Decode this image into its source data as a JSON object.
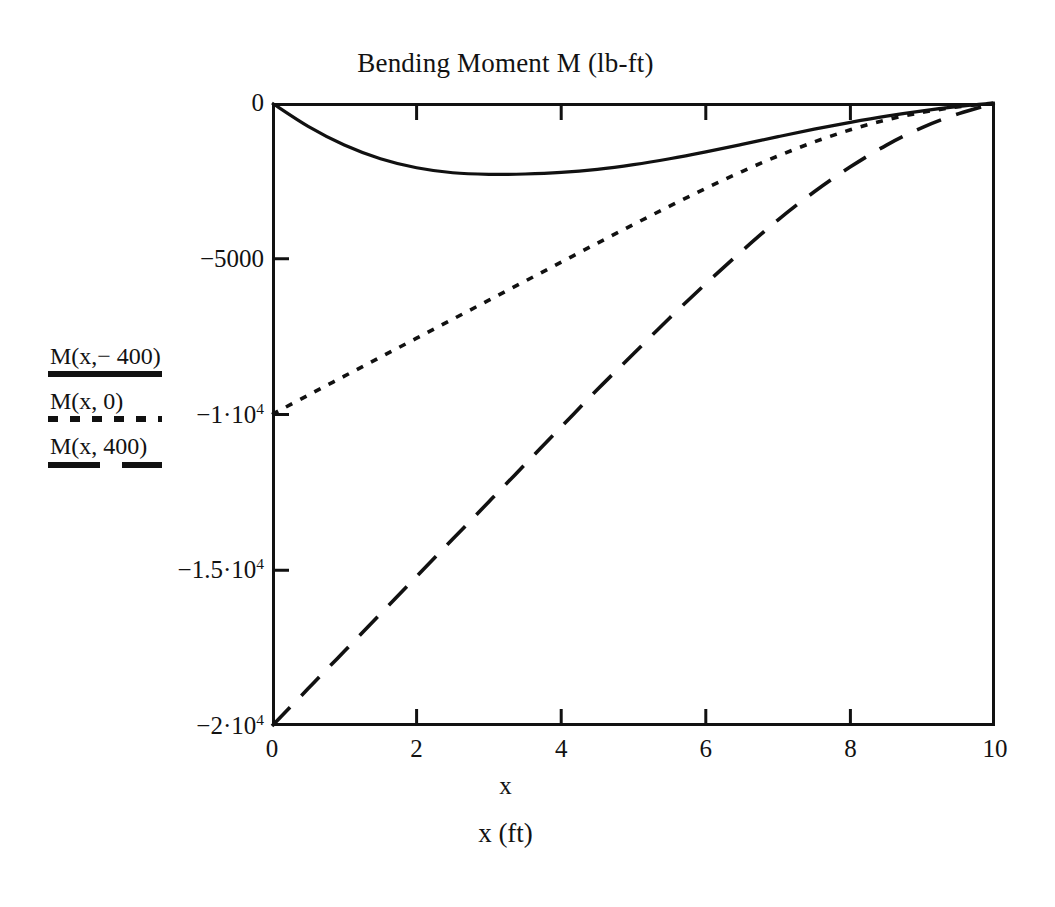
{
  "chart_data": {
    "type": "line",
    "title": "Bending Moment M (lb-ft)",
    "xlabel": "x",
    "xlabel_units": "x (ft)",
    "ylabel": "",
    "xlim": [
      0,
      10
    ],
    "ylim": [
      -20000,
      0
    ],
    "grid": false,
    "legend_position": "left-outside",
    "xticks": [
      "0",
      "2",
      "4",
      "6",
      "8",
      "10"
    ],
    "xtick_values": [
      0,
      2,
      4,
      6,
      8,
      10
    ],
    "ytick_values": [
      0,
      -5000,
      -10000,
      -15000,
      -20000
    ],
    "yticks": [
      {
        "text": "0",
        "mantissa": "0",
        "exponent": ""
      },
      {
        "text": "-5000",
        "mantissa": "−5000",
        "exponent": ""
      },
      {
        "text": "-1·10^4",
        "mantissa": "−1·10",
        "exponent": "4"
      },
      {
        "text": "-1.5·10^4",
        "mantissa": "−1.5·10",
        "exponent": "4"
      },
      {
        "text": "-2·10^4",
        "mantissa": "−2·10",
        "exponent": "4"
      }
    ],
    "series": [
      {
        "name": "M(x,−400)",
        "style": "solid",
        "x": [
          0,
          0.5,
          1,
          1.5,
          2,
          2.5,
          3,
          3.5,
          4,
          4.5,
          5,
          5.5,
          6,
          6.5,
          7,
          7.5,
          8,
          8.5,
          9,
          9.5,
          10
        ],
        "values": [
          0,
          -750,
          -1350,
          -1790,
          -2080,
          -2240,
          -2290,
          -2280,
          -2230,
          -2130,
          -1980,
          -1790,
          -1570,
          -1330,
          -1080,
          -840,
          -620,
          -420,
          -250,
          -110,
          0
        ]
      },
      {
        "name": "M(x,0)",
        "style": "dotted",
        "x": [
          0,
          0.5,
          1,
          1.5,
          2,
          2.5,
          3,
          3.5,
          4,
          4.5,
          5,
          5.5,
          6,
          6.5,
          7,
          7.5,
          8,
          8.5,
          9,
          9.5,
          10
        ],
        "values": [
          -10000,
          -9380,
          -8770,
          -8160,
          -7550,
          -6940,
          -6330,
          -5720,
          -5110,
          -4500,
          -3900,
          -3310,
          -2740,
          -2200,
          -1700,
          -1250,
          -860,
          -540,
          -300,
          -120,
          0
        ]
      },
      {
        "name": "M(x,400)",
        "style": "dashed",
        "x": [
          0,
          0.5,
          1,
          1.5,
          2,
          2.5,
          3,
          3.5,
          4,
          4.5,
          5,
          5.5,
          6,
          6.5,
          7,
          7.5,
          8,
          8.5,
          9,
          9.5,
          10
        ],
        "values": [
          -20000,
          -18800,
          -17600,
          -16400,
          -15200,
          -14000,
          -12800,
          -11600,
          -10400,
          -9200,
          -8050,
          -6900,
          -5800,
          -4750,
          -3750,
          -2850,
          -2050,
          -1350,
          -780,
          -340,
          0
        ]
      }
    ]
  },
  "legend": {
    "entries": [
      {
        "label": "M(x,− 400)",
        "style": "solid"
      },
      {
        "label": "M(x, 0)",
        "style": "dotted"
      },
      {
        "label": "M(x, 400)",
        "style": "dashed"
      }
    ]
  }
}
